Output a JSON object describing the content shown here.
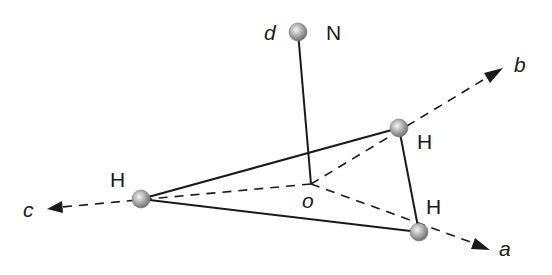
{
  "diagram": {
    "type": "molecular-geometry",
    "atoms": [
      {
        "id": "N",
        "label": "N",
        "point_label": "d",
        "x": 298,
        "y": 32
      },
      {
        "id": "H1",
        "label": "H",
        "x": 399,
        "y": 128
      },
      {
        "id": "H2",
        "label": "H",
        "x": 141,
        "y": 199
      },
      {
        "id": "H3",
        "label": "H",
        "x": 419,
        "y": 232
      }
    ],
    "origin": {
      "label": "o",
      "x": 311,
      "y": 184
    },
    "axes": [
      {
        "label": "a",
        "from": [
          311,
          184
        ],
        "to": [
          490,
          250
        ]
      },
      {
        "label": "b",
        "from": [
          311,
          184
        ],
        "to": [
          503,
          70
        ]
      },
      {
        "label": "c",
        "from": [
          311,
          184
        ],
        "to": [
          48,
          209
        ]
      }
    ],
    "bonds_solid": [
      [
        "N",
        "o"
      ],
      [
        "H1",
        "H2"
      ],
      [
        "H1",
        "H3"
      ],
      [
        "H2",
        "H3"
      ]
    ],
    "colors": {
      "line": "#1a1a1a",
      "atom": "#9a9a9a"
    }
  },
  "labels": {
    "d": "d",
    "N": "N",
    "b": "b",
    "a": "a",
    "c": "c",
    "o": "o",
    "H_top_right": "H",
    "H_left": "H",
    "H_bottom_right": "H"
  }
}
